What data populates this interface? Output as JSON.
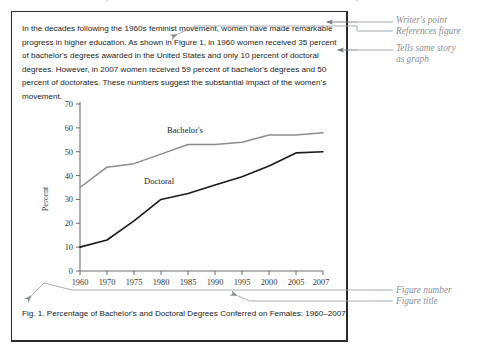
{
  "header": {
    "figure_label": "FIGURE 1-1   Example of a Student Text with a Referenced Graph"
  },
  "document": {
    "paragraph": "In the decades following the 1960s feminist movement, women have made remarkable progress in higher education.  As shown in Figure 1, in 1960 women received 35 percent of bachelor's degrees awarded in the United States and only 10 percent of doctoral degrees.  However, in 2007 women received 59 percent of bachelor's degrees and 50 percent of doctorates.   These numbers suggest the substantial impact of the women's movement.",
    "caption": "Fig. 1.  Percentage of Bachelor's and Doctoral Degrees Conferred on Females: 1960–2007"
  },
  "annotations": {
    "writers_point": "Writer's point\nReferences figure",
    "tells_same_story": "Tells same story\nas graph",
    "figure_number": "Figure number",
    "figure_title": "Figure title"
  },
  "chart_data": {
    "type": "line",
    "title": "",
    "xlabel": "",
    "ylabel": "Percent",
    "ylim": [
      0,
      70
    ],
    "ytick_values": [
      0,
      10,
      20,
      30,
      40,
      50,
      60,
      70
    ],
    "ytick_labels": [
      "0",
      "10",
      "20",
      "30",
      "40",
      "50",
      "60",
      "70"
    ],
    "grid": false,
    "legend": "inline-labels",
    "categories": [
      "1960",
      "1970",
      "1975",
      "1980",
      "1985",
      "1990",
      "1995",
      "2000",
      "2005",
      "2007"
    ],
    "series": [
      {
        "name": "Bachelor's",
        "color": "#8c8c8c",
        "values": [
          35,
          43.5,
          45,
          49,
          53,
          53,
          54,
          57,
          57,
          58
        ]
      },
      {
        "name": "Doctoral",
        "color": "#1a1a1a",
        "values": [
          10,
          13,
          21,
          30,
          32.5,
          36,
          39.5,
          44,
          49.5,
          50
        ]
      }
    ],
    "series_label_positions": [
      {
        "name": "Bachelor's",
        "x_category": "1985",
        "y_value": 57.5
      },
      {
        "name": "Doctoral",
        "x_category": "1982",
        "y_value": 37.5
      }
    ]
  },
  "colors": {
    "border": "#2b2b2b",
    "bachelors_line": "#8c8c8c",
    "doctoral_line": "#1a1a1a",
    "annotation_text": "#8a8f96",
    "axis": "#6e6e6e"
  }
}
